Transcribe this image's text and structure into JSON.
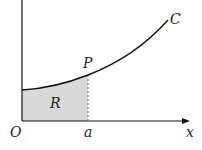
{
  "diagram": {
    "type": "area-under-curve",
    "labels": {
      "origin": "O",
      "x_axis": "x",
      "point": "P",
      "curve": "C",
      "region": "R",
      "x_value": "a"
    },
    "colors": {
      "axis": "#111111",
      "curve": "#111111",
      "region_fill": "#d9d9d9",
      "dashed_line": "#777777"
    }
  }
}
